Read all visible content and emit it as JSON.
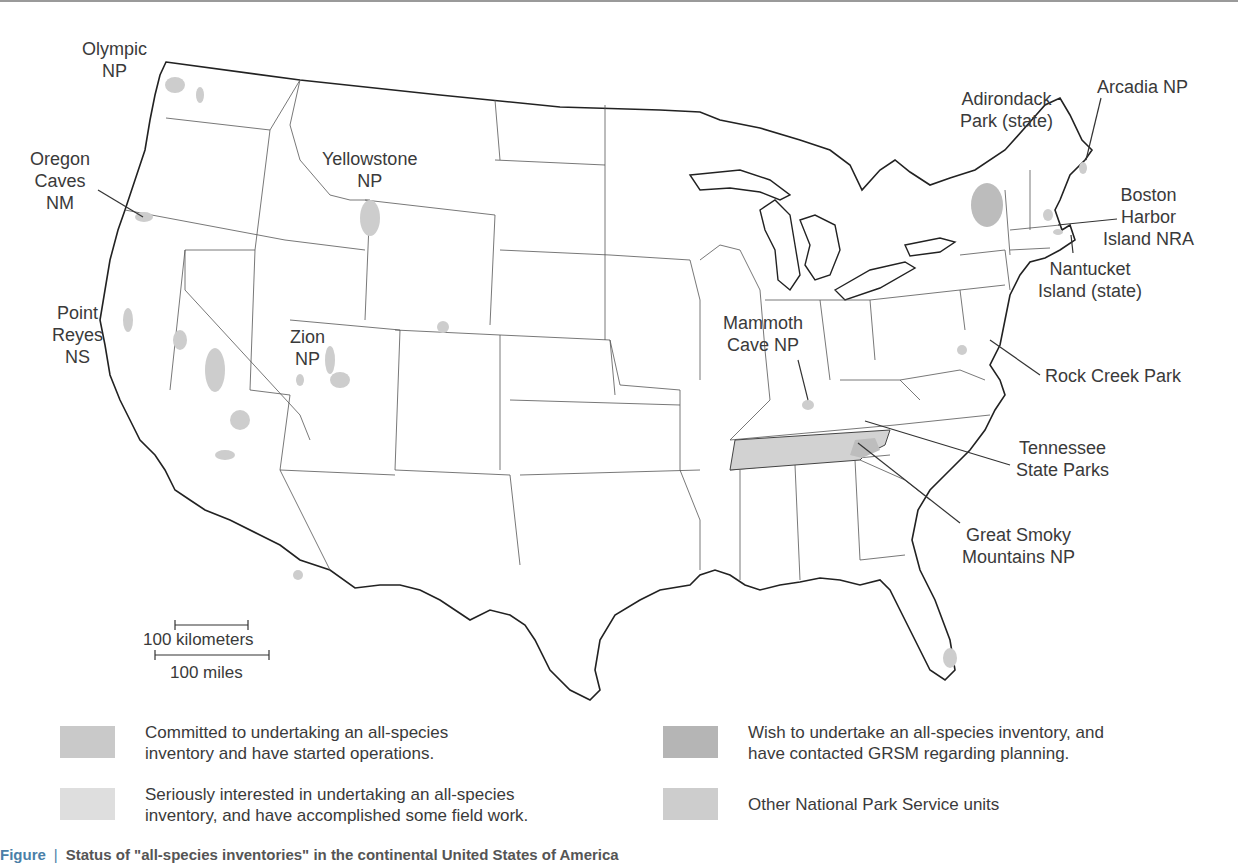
{
  "map": {
    "title": "Continental United States — all-species inventory status",
    "colors": {
      "committed": "#c8c8c8",
      "seriously_interested": "#dcdcdc",
      "wish_contacted": "#b8b8b8",
      "other_nps": "#cfcfcf",
      "outline": "#222222",
      "state_border": "#555555"
    },
    "labels": {
      "olympic": "Olympic\nNP",
      "oregon_caves": "Oregon\nCaves\nNM",
      "yellowstone": "Yellowstone\nNP",
      "point_reyes": "Point\nReyes\nNS",
      "zion": "Zion\nNP",
      "adirondack": "Adirondack\nPark (state)",
      "arcadia": "Arcadia NP",
      "boston_harbor": "Boston\nHarbor\nIsland NRA",
      "nantucket": "Nantucket\nIsland (state)",
      "mammoth_cave": "Mammoth\nCave NP",
      "rock_creek": "Rock Creek Park",
      "tennessee": "Tennessee\nState Parks",
      "great_smoky": "Great Smoky\nMountains NP"
    },
    "scale": {
      "km_label": "100 kilometers",
      "miles_label": "100 miles"
    }
  },
  "legend": [
    {
      "text": "Committed to undertaking an all-species\ninventory and have started operations.",
      "color": "#c9c9c9"
    },
    {
      "text": "Wish to undertake an all-species inventory, and\nhave contacted GRSM regarding planning.",
      "color": "#b5b5b5"
    },
    {
      "text": "Seriously interested in undertaking an all-species\ninventory, and have accomplished some field work.",
      "color": "#dedede"
    },
    {
      "text": "Other National Park Service units",
      "color": "#cdcdcd"
    }
  ],
  "caption": {
    "figure": "Figure",
    "text": "Status of \"all-species inventories\" in the continental United States of America"
  }
}
